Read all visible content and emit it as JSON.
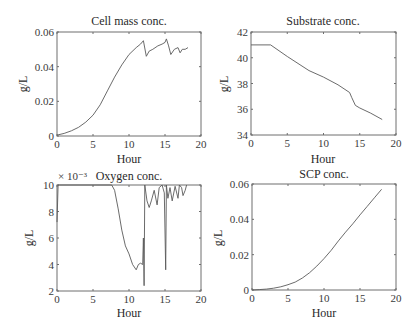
{
  "chart_data": [
    {
      "type": "line",
      "title": "Cell mass conc.",
      "xlabel": "Hour",
      "ylabel": "g/L",
      "xlim": [
        0,
        20
      ],
      "ylim": [
        0,
        0.06
      ],
      "xticks": [
        0,
        5,
        10,
        15,
        20
      ],
      "xtick_labels": [
        "0",
        "5",
        "10",
        "15",
        "20"
      ],
      "yticks": [
        0,
        0.02,
        0.04,
        0.06
      ],
      "ytick_labels": [
        "0",
        "0.02",
        "0.04",
        "0.06"
      ],
      "grid": false,
      "box": {
        "x0": 57,
        "y0": 32,
        "x1": 201,
        "y1": 136
      },
      "series": [
        {
          "name": "Cell mass",
          "x": [
            0,
            1,
            2,
            3,
            4,
            5,
            6,
            7,
            8,
            9,
            10,
            11,
            11.6,
            12.0,
            12.4,
            12.8,
            13.3,
            14.0,
            14.6,
            15.0,
            15.2,
            15.5,
            15.8,
            16.3,
            16.8,
            17.1,
            17.4,
            17.8,
            18.2
          ],
          "y": [
            0.0005,
            0.0015,
            0.003,
            0.005,
            0.008,
            0.012,
            0.018,
            0.026,
            0.034,
            0.041,
            0.047,
            0.051,
            0.053,
            0.055,
            0.046,
            0.049,
            0.05,
            0.052,
            0.053,
            0.054,
            0.056,
            0.052,
            0.047,
            0.05,
            0.051,
            0.048,
            0.05,
            0.05,
            0.051
          ]
        }
      ]
    },
    {
      "type": "line",
      "title": "Substrate conc.",
      "xlabel": "Hour",
      "ylabel": "g/L",
      "xlim": [
        0,
        20
      ],
      "ylim": [
        34,
        42
      ],
      "xticks": [
        0,
        5,
        10,
        15,
        20
      ],
      "xtick_labels": [
        "0",
        "5",
        "10",
        "15",
        "20"
      ],
      "yticks": [
        34,
        36,
        38,
        40,
        42
      ],
      "ytick_labels": [
        "34",
        "36",
        "38",
        "40",
        "42"
      ],
      "grid": false,
      "box": {
        "x0": 251,
        "y0": 32,
        "x1": 396,
        "y1": 135
      },
      "series": [
        {
          "name": "Substrate",
          "x": [
            0,
            2.7,
            5,
            8,
            10,
            12,
            13.6,
            13.9,
            14.4,
            15,
            16.5,
            18.1
          ],
          "y": [
            41.0,
            41.0,
            40.1,
            39.0,
            38.5,
            37.9,
            37.3,
            36.9,
            36.3,
            36.1,
            35.7,
            35.2
          ]
        }
      ]
    },
    {
      "type": "line",
      "title": "Oxygen conc.",
      "xlabel": "Hour",
      "ylabel": "g/L",
      "scale_label": "× 10⁻³",
      "xlim": [
        0,
        20
      ],
      "ylim": [
        2,
        10
      ],
      "xticks": [
        0,
        5,
        10,
        15,
        20
      ],
      "xtick_labels": [
        "0",
        "5",
        "10",
        "15",
        "20"
      ],
      "yticks": [
        2,
        4,
        6,
        8,
        10
      ],
      "ytick_labels": [
        "2",
        "4",
        "6",
        "8",
        "10"
      ],
      "grid": false,
      "box": {
        "x0": 57,
        "y0": 185,
        "x1": 201,
        "y1": 291
      },
      "series": [
        {
          "name": "Oxygen (×10⁻³ g/L)",
          "x": [
            0,
            0.15,
            0.3,
            7.6,
            8.0,
            8.5,
            9.0,
            9.5,
            10.0,
            10.5,
            11.0,
            11.3,
            11.6,
            11.9,
            12.0,
            12.1,
            12.2,
            12.5,
            12.8,
            13.1,
            13.5,
            13.9,
            14.2,
            14.6,
            14.9,
            15.1,
            15.2,
            15.4,
            15.7,
            16.0,
            16.4,
            16.8,
            17.0,
            17.3,
            17.5,
            17.8,
            18.0
          ],
          "y": [
            7.2,
            10,
            10,
            10,
            9.6,
            8.2,
            6.6,
            5.4,
            4.8,
            4.0,
            3.6,
            4.0,
            4.1,
            4.0,
            6.0,
            2.4,
            10,
            8.8,
            8.3,
            8.8,
            9.6,
            8.5,
            9.8,
            10,
            9.4,
            3.6,
            10,
            9.0,
            9.8,
            8.8,
            9.9,
            9.0,
            10,
            9.8,
            9.2,
            9.6,
            10
          ]
        }
      ]
    },
    {
      "type": "line",
      "title": "SCP conc.",
      "xlabel": "Hour",
      "ylabel": "g/L",
      "xlim": [
        0,
        20
      ],
      "ylim": [
        0,
        0.06
      ],
      "xticks": [
        0,
        5,
        10,
        15,
        20
      ],
      "xtick_labels": [
        "0",
        "5",
        "10",
        "15",
        "20"
      ],
      "yticks": [
        0,
        0.02,
        0.04,
        0.06
      ],
      "ytick_labels": [
        "0",
        "0.02",
        "0.04",
        "0.06"
      ],
      "grid": false,
      "box": {
        "x0": 252,
        "y0": 184,
        "x1": 396,
        "y1": 290
      },
      "series": [
        {
          "name": "SCP",
          "x": [
            0,
            1,
            2,
            3,
            4,
            5,
            6,
            7,
            8,
            9,
            10,
            11,
            12,
            13,
            14,
            15,
            16,
            17,
            18
          ],
          "y": [
            0,
            0.0002,
            0.0005,
            0.001,
            0.0018,
            0.003,
            0.0045,
            0.0068,
            0.0098,
            0.0135,
            0.0178,
            0.0225,
            0.0278,
            0.0328,
            0.0375,
            0.0425,
            0.0473,
            0.0522,
            0.057
          ]
        }
      ]
    }
  ]
}
